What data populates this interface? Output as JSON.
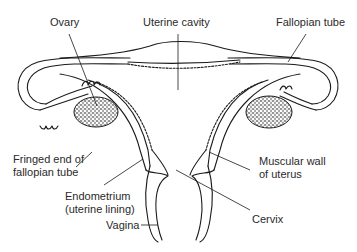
{
  "diagram": {
    "line_color": "#1a1a1a",
    "background": "#ffffff",
    "labels": {
      "ovary": "Ovary",
      "uterine_cavity": "Uterine cavity",
      "fallopian_tube": "Fallopian tube",
      "fringed_end_line1": "Fringed end of",
      "fringed_end_line2": "fallopian tube",
      "muscular_wall_line1": "Muscular wall",
      "muscular_wall_line2": "of uterus",
      "endometrium_line1": "Endometrium",
      "endometrium_line2": "(uterine lining)",
      "cervix": "Cervix",
      "vagina": "Vagina"
    }
  }
}
